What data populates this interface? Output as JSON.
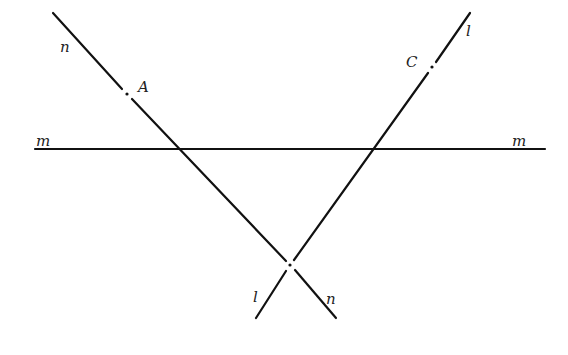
{
  "diagram": {
    "type": "geometry",
    "lines": [
      {
        "name": "m",
        "segments": [
          [
            35,
            149,
            545,
            149
          ]
        ],
        "labels": [
          {
            "text": "m",
            "x": 36,
            "y": 146
          },
          {
            "text": "m",
            "x": 512,
            "y": 146
          }
        ]
      },
      {
        "name": "n",
        "segments": [
          [
            53,
            13,
            122,
            89
          ],
          [
            132,
            99,
            286,
            261
          ],
          [
            295,
            270,
            336,
            318
          ]
        ],
        "labels": [
          {
            "text": "n",
            "x": 60,
            "y": 52
          },
          {
            "text": "n",
            "x": 326,
            "y": 304
          }
        ]
      },
      {
        "name": "l",
        "segments": [
          [
            470,
            13,
            436,
            62
          ],
          [
            428,
            73,
            294,
            260
          ],
          [
            286,
            271,
            256,
            318
          ]
        ],
        "labels": [
          {
            "text": "l",
            "x": 466,
            "y": 36
          },
          {
            "text": "l",
            "x": 253,
            "y": 302
          }
        ]
      }
    ],
    "points": [
      {
        "name": "A",
        "x": 127,
        "y": 94,
        "label": "A",
        "lx": 138,
        "ly": 92
      },
      {
        "name": "C",
        "x": 432,
        "y": 67,
        "label": "C",
        "lx": 406,
        "ly": 67
      },
      {
        "name": "intersection_l_n",
        "x": 290,
        "y": 265,
        "label": ""
      }
    ]
  }
}
